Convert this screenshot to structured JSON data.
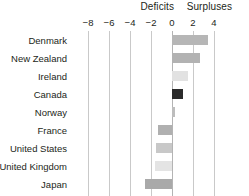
{
  "chart_data": {
    "type": "bar",
    "orientation": "horizontal",
    "title": "",
    "xlabel": "",
    "ylabel": "",
    "xlim": [
      -9.2,
      4.6
    ],
    "grid": true,
    "gridlines": [
      -8,
      -6,
      -4,
      -2,
      0,
      2,
      4
    ],
    "tick_labels": [
      "−8",
      "−6",
      "−4",
      "−2",
      "0",
      "2",
      "4"
    ],
    "band_labels": [
      {
        "text": "Deficits",
        "value": -3.0
      },
      {
        "text": "Surpluses",
        "value": 1.4
      }
    ],
    "categories": [
      "Denmark",
      "New Zealand",
      "Ireland",
      "Canada",
      "Norway",
      "France",
      "United States",
      "United Kingdom",
      "Japan"
    ],
    "values": [
      3.4,
      2.7,
      1.5,
      1.0,
      0.3,
      -1.3,
      -1.5,
      -1.6,
      -2.6
    ],
    "bar_colors": [
      "#b6b6b6",
      "#b2b2b2",
      "#e2e2e2",
      "#2b2b2b",
      "#bdbdbd",
      "#b0b0b0",
      "#c8c8c8",
      "#e4e4e4",
      "#a9a9a9"
    ],
    "colors": {
      "background": "#ffffff",
      "text": "#231f20",
      "gridline": "#c9c9c9",
      "zeroline": "#b4b4b4"
    }
  }
}
